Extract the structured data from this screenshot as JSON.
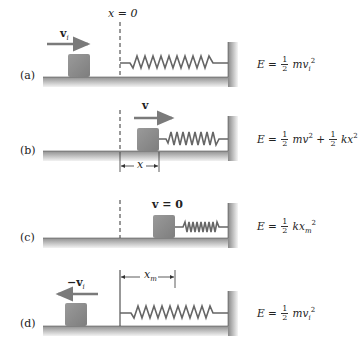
{
  "figure": {
    "origin_label": "x = 0",
    "panels": [
      {
        "id": "a",
        "label": "(a)",
        "velocity_label": "v",
        "velocity_subscript": "i",
        "velocity_direction": "right",
        "equation": {
          "lhs": "E =",
          "frac": [
            "1",
            "2"
          ],
          "term": "mv",
          "sub": "i",
          "sup": "2"
        }
      },
      {
        "id": "b",
        "label": "(b)",
        "velocity_label": "v",
        "velocity_direction": "right",
        "displacement_label": "x",
        "equation": {
          "lhs": "E =",
          "frac1": [
            "1",
            "2"
          ],
          "term1": "mv",
          "sup1": "2",
          "plus": "+",
          "frac2": [
            "1",
            "2"
          ],
          "term2": "kx",
          "sup2": "2"
        }
      },
      {
        "id": "c",
        "label": "(c)",
        "velocity_label": "v = 0",
        "equation": {
          "lhs": "E =",
          "frac": [
            "1",
            "2"
          ],
          "term": "kx",
          "sub": "m",
          "sup": "2"
        }
      },
      {
        "id": "d",
        "label": "(d)",
        "velocity_label": "−v",
        "velocity_subscript": "i",
        "velocity_direction": "left",
        "displacement_label": "x",
        "displacement_subscript": "m",
        "equation": {
          "lhs": "E =",
          "frac": [
            "1",
            "2"
          ],
          "term": "mv",
          "sub": "i",
          "sup": "2"
        }
      }
    ],
    "colors": {
      "block": "#8c8c8c",
      "arrow": "#7a7a7a",
      "ground_top": "#9a9a9a",
      "ground_bottom": "#e8e8e8",
      "spring": "#666666",
      "line": "#333333"
    }
  }
}
